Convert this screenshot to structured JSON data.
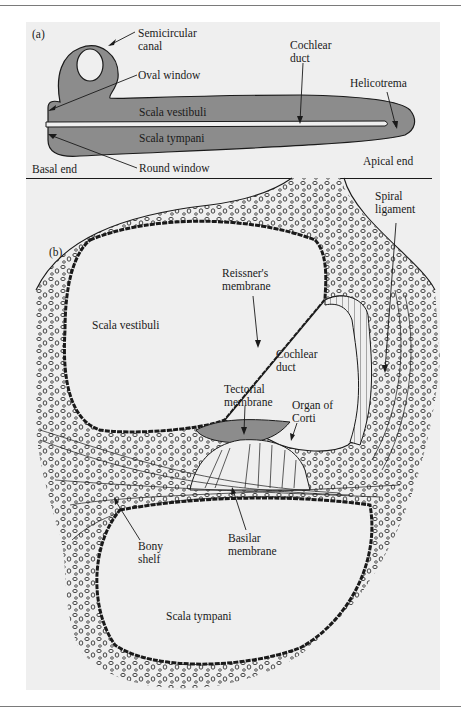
{
  "figure": {
    "panel_a": {
      "tag": "(a)",
      "labels": {
        "semicircular_canal": [
          "Semicircular",
          "canal"
        ],
        "oval_window": "Oval window",
        "cochlear_duct": [
          "Cochlear",
          "duct"
        ],
        "helicotrema": "Helicotrema",
        "scala_vestibuli": "Scala vestibuli",
        "scala_tympani": "Scala tympani",
        "basal_end": "Basal end",
        "round_window": "Round window",
        "apical_end": "Apical end"
      }
    },
    "panel_b": {
      "tag": "(b)",
      "labels": {
        "spiral_ligament": [
          "Spiral",
          "ligament"
        ],
        "reissners_membrane": [
          "Reissner's",
          "membrane"
        ],
        "scala_vestibuli": "Scala vestibuli",
        "cochlear_duct": [
          "Cochlear",
          "duct"
        ],
        "tectorial_membrane": [
          "Tectorial",
          "membrane"
        ],
        "organ_of_corti": [
          "Organ of",
          "Corti"
        ],
        "bony_shelf": [
          "Bony",
          "shelf"
        ],
        "basilar_membrane": [
          "Basilar",
          "membrane"
        ],
        "scala_tympani": "Scala tympani"
      }
    },
    "colors": {
      "panel_bg": "#efefef",
      "fluid_fill": "#8c8c8c",
      "outline": "#1a1a1a"
    }
  }
}
